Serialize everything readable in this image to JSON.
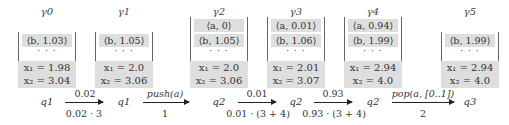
{
  "configurations": [
    {
      "gamma": "γ0",
      "stack": [
        "⟨b, 1.03⟩"
      ],
      "x1": "x₁ = 1.98",
      "x2": "x₂ = 3.04",
      "state": "q1"
    },
    {
      "gamma": "γ1",
      "stack": [
        "⟨b, 1.05⟩"
      ],
      "x1": "x₁ = 2.0",
      "x2": "x₂ = 3.06",
      "state": "q1"
    },
    {
      "gamma": "γ2",
      "stack": [
        "⟨a, 0⟩",
        "⟨b, 1.05⟩"
      ],
      "x1": "x₁ = 2.0",
      "x2": "x₂ = 3.06",
      "state": "q2"
    },
    {
      "gamma": "γ3",
      "stack": [
        "⟨a, 0.01⟩",
        "⟨b, 1.06⟩"
      ],
      "x1": "x₁ = 2.01",
      "x2": "x₂ = 3.07",
      "state": "q2"
    },
    {
      "gamma": "γ4",
      "stack": [
        "⟨a, 0.94⟩",
        "⟨b, 1.99⟩"
      ],
      "x1": "x₁ = 2.94",
      "x2": "x₂ = 4.0",
      "state": "q2"
    },
    {
      "gamma": "γ5",
      "stack": [
        "⟨b, 1.99⟩"
      ],
      "x1": "x₁ = 2.94",
      "x2": "x₂ = 4.0",
      "state": "q3"
    }
  ],
  "stack_ellipsis": "· · ·",
  "transitions": [
    {
      "top": "0.02",
      "bottom": "0.02 · 3"
    },
    {
      "top": "push(a)",
      "bottom": "1"
    },
    {
      "top": "0.01",
      "bottom": "0.01 · (3 + 4)"
    },
    {
      "top": "0.93",
      "bottom": "0.93 · (3 + 4)"
    },
    {
      "top": "pop(a, [0..1])",
      "bottom": "2"
    }
  ],
  "colors": {
    "frame_fill": "#dedede",
    "text": "#333333",
    "arrow": "#222222"
  }
}
